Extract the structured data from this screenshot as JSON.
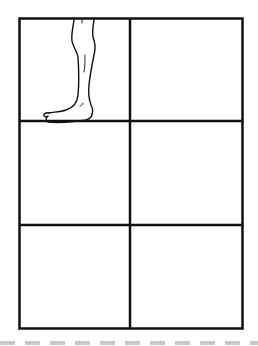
{
  "diagram": {
    "type": "storyboard-grid",
    "rows": 3,
    "columns": 2,
    "line_color": "#111111",
    "panels": [
      {
        "row": 1,
        "col": 1,
        "content": "leg-sketch",
        "description": "Line drawing of a lower leg and bare foot, toes pointing left"
      },
      {
        "row": 1,
        "col": 2,
        "content": "empty"
      },
      {
        "row": 2,
        "col": 1,
        "content": "empty"
      },
      {
        "row": 2,
        "col": 2,
        "content": "empty"
      },
      {
        "row": 3,
        "col": 1,
        "content": "empty"
      },
      {
        "row": 3,
        "col": 2,
        "content": "empty"
      }
    ]
  },
  "cut_line": {
    "style": "dashed",
    "color": "#c8c8c8"
  }
}
